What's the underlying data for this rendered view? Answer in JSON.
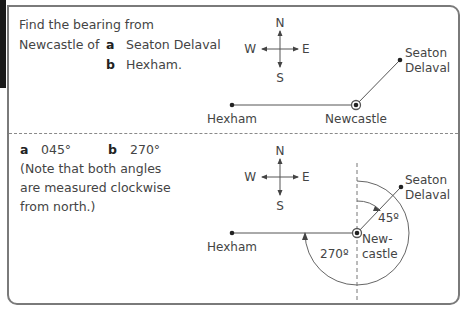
{
  "question": {
    "line1": "Find the bearing from",
    "line2_prefix": "Newcastle of",
    "part_a_label": "a",
    "part_a_text": "Seaton Delaval",
    "part_b_label": "b",
    "part_b_text": "Hexham."
  },
  "answer": {
    "part_a_label": "a",
    "part_a_value": "045°",
    "part_b_label": "b",
    "part_b_value": "270°",
    "note_line1": "(Note that both angles",
    "note_line2": "are measured clockwise",
    "note_line3": "from north.)"
  },
  "compass": {
    "n": "N",
    "e": "E",
    "s": "S",
    "w": "W"
  },
  "places": {
    "seaton_line1": "Seaton",
    "seaton_line2": "Delaval",
    "hexham": "Hexham",
    "newcastle": "Newcastle",
    "newcastle_split1": "New-",
    "newcastle_split2": "castle"
  },
  "angles": {
    "bearing_a": "45º",
    "bearing_b": "270º"
  },
  "colors": {
    "line": "#555555",
    "border": "#7a7a7a",
    "text": "#444444"
  }
}
